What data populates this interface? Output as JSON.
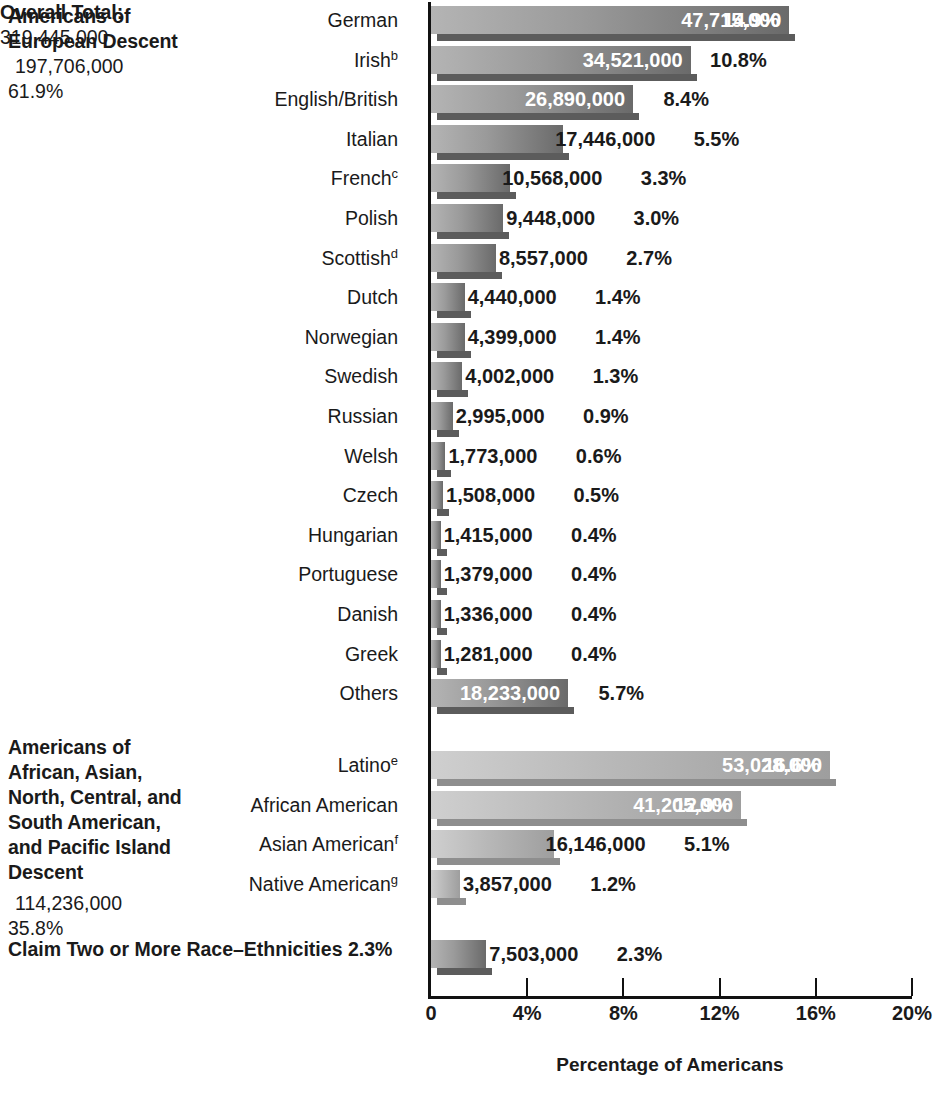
{
  "chart_data": {
    "type": "bar",
    "title": "",
    "xlabel": "Percentage of Americans",
    "ylabel": "",
    "xlim": [
      0,
      20
    ],
    "xticks": [
      0,
      4,
      8,
      12,
      16,
      20
    ],
    "xtick_labels": [
      "0",
      "4%",
      "8%",
      "12%",
      "16%",
      "20%"
    ],
    "grid": false,
    "orientation": "horizontal",
    "categories": [
      "German",
      "Irish",
      "English/British",
      "Italian",
      "French",
      "Polish",
      "Scottish",
      "Dutch",
      "Norwegian",
      "Swedish",
      "Russian",
      "Welsh",
      "Czech",
      "Hungarian",
      "Portuguese",
      "Danish",
      "Greek",
      "Others",
      "Latino",
      "African American",
      "Asian American",
      "Native American",
      "Claim Two or More Race–Ethnicities"
    ],
    "values": [
      14.9,
      10.8,
      8.4,
      5.5,
      3.3,
      3.0,
      2.7,
      1.4,
      1.4,
      1.3,
      0.9,
      0.6,
      0.5,
      0.4,
      0.4,
      0.4,
      0.4,
      5.7,
      16.6,
      12.9,
      5.1,
      1.2,
      2.3
    ],
    "counts": [
      47715000,
      34521000,
      26890000,
      17446000,
      10568000,
      9448000,
      8557000,
      4440000,
      4399000,
      4002000,
      2995000,
      1773000,
      1508000,
      1415000,
      1379000,
      1336000,
      1281000,
      18233000,
      53028000,
      41205000,
      16146000,
      3857000,
      7503000
    ]
  },
  "axis": {
    "xlabel": "Percentage of Americans",
    "ticks": [
      {
        "value": 0,
        "label": "0"
      },
      {
        "value": 4,
        "label": "4%"
      },
      {
        "value": 8,
        "label": "8%"
      },
      {
        "value": 12,
        "label": "12%"
      },
      {
        "value": 16,
        "label": "16%"
      },
      {
        "value": 20,
        "label": "20%"
      }
    ]
  },
  "groups": {
    "european": {
      "title_line1": "Americans of",
      "title_line2": "European Descent",
      "total_count": "197,706,000",
      "total_pct": "61.9%"
    },
    "other": {
      "title_line1": "Americans of",
      "title_line2": "African, Asian,",
      "title_line3": "North, Central, and",
      "title_line4": "South American,",
      "title_line5": "and Pacific Island",
      "title_line6": "Descent",
      "total_count": "114,236,000",
      "total_pct": "35.8%"
    }
  },
  "claim_row": {
    "label": "Claim Two or More Race–Ethnicities 2.3%",
    "count": "7,503,000",
    "pct": "2.3%"
  },
  "overall": {
    "label": "Overall Total:",
    "value": "319,445,000"
  },
  "rows": [
    {
      "label": "German",
      "sup": "",
      "count": "47,715,000",
      "pct": "14.9%",
      "value": 14.9,
      "count_inside": true,
      "pct_inside": true,
      "shade": "dark"
    },
    {
      "label": "Irish",
      "sup": "b",
      "count": "34,521,000",
      "pct": "10.8%",
      "value": 10.8,
      "count_inside": true,
      "pct_inside": false,
      "shade": "dark"
    },
    {
      "label": "English/British",
      "sup": "",
      "count": "26,890,000",
      "pct": "8.4%",
      "value": 8.4,
      "count_inside": true,
      "pct_inside": false,
      "shade": "dark"
    },
    {
      "label": "Italian",
      "sup": "",
      "count": "17,446,000",
      "pct": "5.5%",
      "value": 5.5,
      "count_inside": false,
      "pct_inside": false,
      "shade": "dark"
    },
    {
      "label": "French",
      "sup": "c",
      "count": "10,568,000",
      "pct": "3.3%",
      "value": 3.3,
      "count_inside": false,
      "pct_inside": false,
      "shade": "dark"
    },
    {
      "label": "Polish",
      "sup": "",
      "count": "9,448,000",
      "pct": "3.0%",
      "value": 3.0,
      "count_inside": false,
      "pct_inside": false,
      "shade": "dark"
    },
    {
      "label": "Scottish",
      "sup": "d",
      "count": "8,557,000",
      "pct": "2.7%",
      "value": 2.7,
      "count_inside": false,
      "pct_inside": false,
      "shade": "dark"
    },
    {
      "label": "Dutch",
      "sup": "",
      "count": "4,440,000",
      "pct": "1.4%",
      "value": 1.4,
      "count_inside": false,
      "pct_inside": false,
      "shade": "dark"
    },
    {
      "label": "Norwegian",
      "sup": "",
      "count": "4,399,000",
      "pct": "1.4%",
      "value": 1.4,
      "count_inside": false,
      "pct_inside": false,
      "shade": "dark"
    },
    {
      "label": "Swedish",
      "sup": "",
      "count": "4,002,000",
      "pct": "1.3%",
      "value": 1.3,
      "count_inside": false,
      "pct_inside": false,
      "shade": "dark"
    },
    {
      "label": "Russian",
      "sup": "",
      "count": "2,995,000",
      "pct": "0.9%",
      "value": 0.9,
      "count_inside": false,
      "pct_inside": false,
      "shade": "dark"
    },
    {
      "label": "Welsh",
      "sup": "",
      "count": "1,773,000",
      "pct": "0.6%",
      "value": 0.6,
      "count_inside": false,
      "pct_inside": false,
      "shade": "dark"
    },
    {
      "label": "Czech",
      "sup": "",
      "count": "1,508,000",
      "pct": "0.5%",
      "value": 0.5,
      "count_inside": false,
      "pct_inside": false,
      "shade": "dark"
    },
    {
      "label": "Hungarian",
      "sup": "",
      "count": "1,415,000",
      "pct": "0.4%",
      "value": 0.4,
      "count_inside": false,
      "pct_inside": false,
      "shade": "dark"
    },
    {
      "label": "Portuguese",
      "sup": "",
      "count": "1,379,000",
      "pct": "0.4%",
      "value": 0.4,
      "count_inside": false,
      "pct_inside": false,
      "shade": "dark"
    },
    {
      "label": "Danish",
      "sup": "",
      "count": "1,336,000",
      "pct": "0.4%",
      "value": 0.4,
      "count_inside": false,
      "pct_inside": false,
      "shade": "dark"
    },
    {
      "label": "Greek",
      "sup": "",
      "count": "1,281,000",
      "pct": "0.4%",
      "value": 0.4,
      "count_inside": false,
      "pct_inside": false,
      "shade": "dark"
    },
    {
      "label": "Others",
      "sup": "",
      "count": "18,233,000",
      "pct": "5.7%",
      "value": 5.7,
      "count_inside": true,
      "pct_inside": false,
      "shade": "dark"
    },
    {
      "label": "Latino",
      "sup": "e",
      "count": "53,028,000",
      "pct": "16.6%",
      "value": 16.6,
      "count_inside": true,
      "pct_inside": true,
      "shade": "light"
    },
    {
      "label": "African American",
      "sup": "",
      "count": "41,205,000",
      "pct": "12.9%",
      "value": 12.9,
      "count_inside": true,
      "pct_inside": true,
      "shade": "light"
    },
    {
      "label": "Asian American",
      "sup": "f",
      "count": "16,146,000",
      "pct": "5.1%",
      "value": 5.1,
      "count_inside": false,
      "pct_inside": false,
      "shade": "light"
    },
    {
      "label": "Native American",
      "sup": "g",
      "count": "3,857,000",
      "pct": "1.2%",
      "value": 1.2,
      "count_inside": false,
      "pct_inside": false,
      "shade": "light"
    }
  ]
}
